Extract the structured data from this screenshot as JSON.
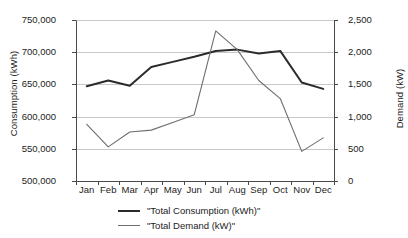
{
  "chart_data": {
    "type": "line",
    "title": "",
    "subtitle": "",
    "xlabel": "",
    "ylabel": "Consumption (kWh)",
    "y2label": "Demand (kW)",
    "grid": true,
    "legend_position": "bottom",
    "categories": [
      "Jan",
      "Feb",
      "Mar",
      "Apr",
      "May",
      "Jun",
      "Jul",
      "Aug",
      "Sep",
      "Oct",
      "Nov",
      "Dec"
    ],
    "ylim": [
      500000,
      750000
    ],
    "yticks": [
      500000,
      550000,
      600000,
      650000,
      700000,
      750000
    ],
    "ytick_labels": [
      "500,000",
      "550,000",
      "600,000",
      "650,000",
      "700,000",
      "750,000"
    ],
    "y2lim": [
      0,
      2500
    ],
    "y2ticks": [
      0,
      500,
      1000,
      1500,
      2000,
      2500
    ],
    "y2tick_labels": [
      "0",
      "500",
      "1,000",
      "1,500",
      "2,000",
      "2,500"
    ],
    "series": [
      {
        "name": "\"Total Consumption (kWh)\"",
        "axis": "left",
        "color": "#2b2b2b",
        "width": 2.0,
        "values": [
          647000,
          656000,
          648000,
          677000,
          685000,
          693000,
          702000,
          704000,
          698000,
          702000,
          653000,
          643000
        ]
      },
      {
        "name": "\"Total Demand (kW)\"",
        "axis": "right",
        "color": "#6e6e6e",
        "width": 1.1,
        "values": [
          880,
          530,
          760,
          790,
          910,
          1030,
          2330,
          2040,
          1560,
          1280,
          460,
          670
        ]
      }
    ]
  },
  "legend": {
    "items": [
      {
        "label": "\"Total Consumption (kWh)\"",
        "color": "#2b2b2b"
      },
      {
        "label": "\"Total Demand (kW)\"",
        "color": "#6e6e6e"
      }
    ]
  },
  "colors": {
    "consumption": "#2b2b2b",
    "demand": "#6e6e6e",
    "grid": "#c8c8c8",
    "axis": "#4a4a4a",
    "text": "#1c1c1c",
    "background": "#ffffff"
  }
}
